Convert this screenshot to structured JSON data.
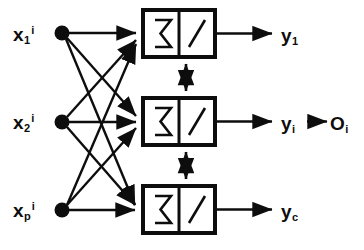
{
  "diagram": {
    "type": "neural-network-diagram",
    "colors": {
      "background": "#ffffff",
      "stroke": "#0d0d0d",
      "node_fill": "#0d0d0d"
    },
    "inputs": [
      {
        "id": "x1",
        "base": "x",
        "subscript": "1",
        "superscript": "i"
      },
      {
        "id": "x2",
        "base": "x",
        "subscript": "2",
        "superscript": "i"
      },
      {
        "id": "xp",
        "base": "x",
        "subscript": "p",
        "superscript": "i"
      }
    ],
    "units": [
      {
        "id": "unit-1",
        "sum_symbol": "Σ",
        "activation_symbol": "ramp"
      },
      {
        "id": "unit-i",
        "sum_symbol": "Σ",
        "activation_symbol": "ramp"
      },
      {
        "id": "unit-c",
        "sum_symbol": "Σ",
        "activation_symbol": "ramp"
      }
    ],
    "outputs": [
      {
        "id": "y1",
        "base": "y",
        "subscript": "1"
      },
      {
        "id": "yi",
        "base": "y",
        "subscript": "i"
      },
      {
        "id": "yc",
        "base": "y",
        "subscript": "c"
      }
    ],
    "final_output": {
      "id": "Oi",
      "base": "O",
      "subscript": "i"
    },
    "lateral_links": [
      {
        "from": "unit-1",
        "to": "unit-i",
        "arrow": "double-headed"
      },
      {
        "from": "unit-i",
        "to": "unit-c",
        "arrow": "double-headed"
      }
    ],
    "connections_note": "each input node connects to all three units"
  }
}
